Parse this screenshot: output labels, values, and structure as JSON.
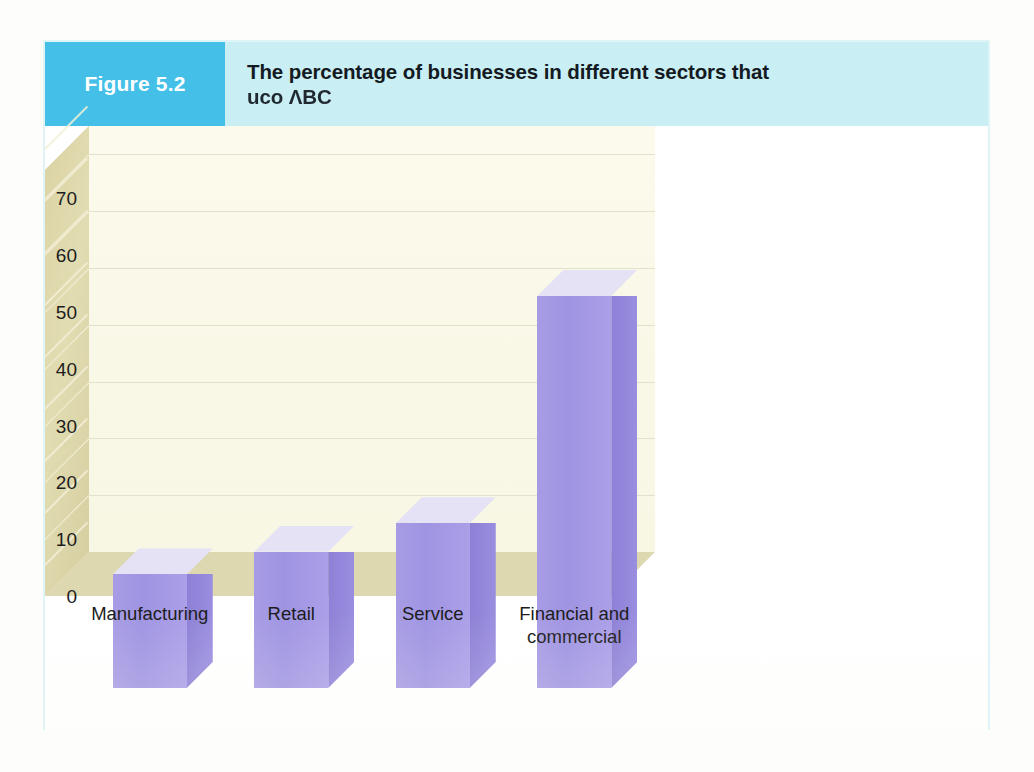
{
  "figure": {
    "badge_label": "Figure 5.2",
    "title_line_1": "The percentage of businesses in different sectors that",
    "title_line_2": "uco ΛBC",
    "badge_color": "#44c0e8",
    "title_band_color": "#c9eef3",
    "border_color": "#dff4f7"
  },
  "chart_data": {
    "type": "bar",
    "categories": [
      "Manufacturing",
      "Retail",
      "Service",
      "Financial and commercial"
    ],
    "category_labels": [
      "Manufacturing",
      "Retail",
      "Service",
      "Financial and\ncommercial"
    ],
    "values": [
      20,
      24,
      29,
      69
    ],
    "xlabel": "",
    "ylabel": "%",
    "ylim": [
      0,
      75
    ],
    "yticks": [
      0,
      10,
      20,
      30,
      40,
      50,
      60,
      70
    ],
    "ytick_labels": [
      "0",
      "10",
      "20",
      "30",
      "40",
      "50",
      "60",
      "70"
    ],
    "grid": true,
    "legend": false,
    "style": "3d-column",
    "bar_color_front": "#a298e3",
    "bar_color_side": "#8d80d6",
    "bar_color_top": "#e6e2f6",
    "wall_color": "#dcd6ab",
    "floor_color": "#ded8b0",
    "plot_background": "#faf9e9"
  }
}
